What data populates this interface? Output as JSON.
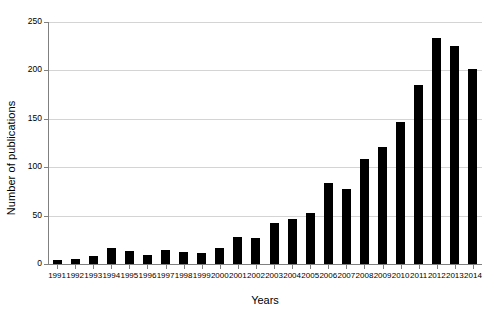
{
  "chart_data": {
    "type": "bar",
    "title": "",
    "xlabel": "Years",
    "ylabel": "Number of publications",
    "categories": [
      "1991",
      "1992",
      "1993",
      "1994",
      "1995",
      "1996",
      "1997",
      "1998",
      "1999",
      "2000",
      "2001",
      "2002",
      "2003",
      "2004",
      "2005",
      "2006",
      "2007",
      "2008",
      "2009",
      "2010",
      "2011",
      "2012",
      "2013",
      "2014"
    ],
    "values": [
      4,
      5,
      8,
      17,
      13,
      9,
      14,
      12,
      11,
      17,
      28,
      27,
      42,
      47,
      53,
      84,
      78,
      108,
      121,
      147,
      185,
      234,
      225,
      201
    ],
    "ylim": [
      0,
      250
    ],
    "yticks": [
      0,
      50,
      100,
      150,
      200,
      250
    ],
    "ytick_labels": [
      "0",
      "50",
      "100",
      "150",
      "200",
      "250"
    ],
    "grid": true,
    "legend": false,
    "series_color": "#000000",
    "grid_color": "#d4d4d4",
    "axis_color": "#808080",
    "background": "#ffffff"
  }
}
